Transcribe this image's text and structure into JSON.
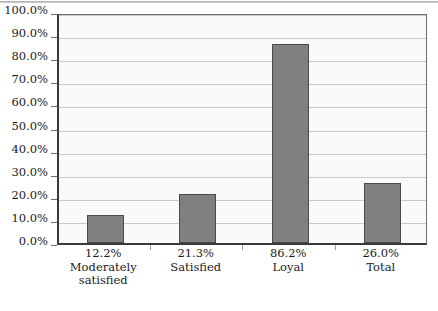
{
  "chart_data": {
    "type": "bar",
    "title": "",
    "subtitle": "",
    "xlabel": "",
    "ylabel": "",
    "categories": [
      "Moderately satisfied",
      "Satisfied",
      "Loyal",
      "Total"
    ],
    "category_lines": [
      [
        "12.2%",
        "Moderately",
        "satisfied"
      ],
      [
        "21.3%",
        "Satisfied"
      ],
      [
        "86.2%",
        "Loyal"
      ],
      [
        "26.0%",
        "Total"
      ]
    ],
    "values": [
      12.2,
      21.3,
      86.2,
      26.0
    ],
    "value_labels": [
      "12.2%",
      "21.3%",
      "86.2%",
      "26.0%"
    ],
    "ylim": [
      0,
      100
    ],
    "ytick_labels": [
      "100.0%",
      "90.0%",
      "80.0%",
      "70.0%",
      "60.0%",
      "50.0%",
      "40.0%",
      "30.0%",
      "20.0%",
      "10.0%",
      "0.0%"
    ],
    "ytick_values": [
      100,
      90,
      80,
      70,
      60,
      50,
      40,
      30,
      20,
      10,
      0
    ],
    "grid": true,
    "legend": false,
    "legend_position": "none",
    "colors": {
      "bar_fill": "#808080",
      "bar_outline": "#4a4a4a",
      "plot_background": "#fafafa",
      "gridline": "#c9c9c9",
      "axis": "#3a3a3a",
      "text": "#1a1a1a"
    }
  }
}
